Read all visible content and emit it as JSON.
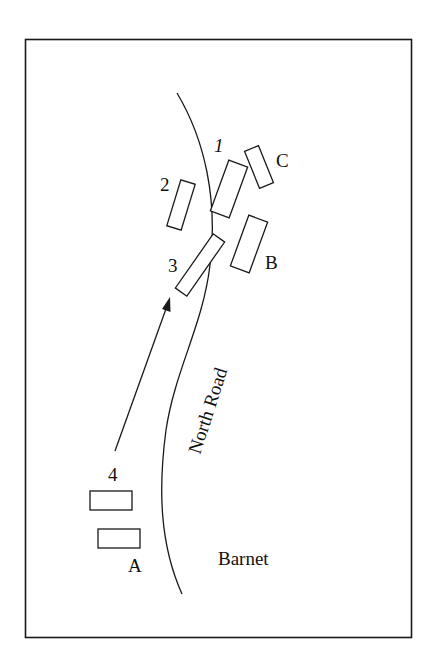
{
  "diagram": {
    "type": "battle-map",
    "stroke_color": "#1a1a1a",
    "background": "#ffffff",
    "road_label": "North Road",
    "place_label": "Barnet",
    "units": [
      {
        "id": "1",
        "label": "1"
      },
      {
        "id": "2",
        "label": "2"
      },
      {
        "id": "3",
        "label": "3"
      },
      {
        "id": "4",
        "label": "4"
      },
      {
        "id": "A",
        "label": "A"
      },
      {
        "id": "B",
        "label": "B"
      },
      {
        "id": "C",
        "label": "C"
      }
    ],
    "arrow": {
      "from_unit": "4",
      "direction": "north-east"
    }
  }
}
